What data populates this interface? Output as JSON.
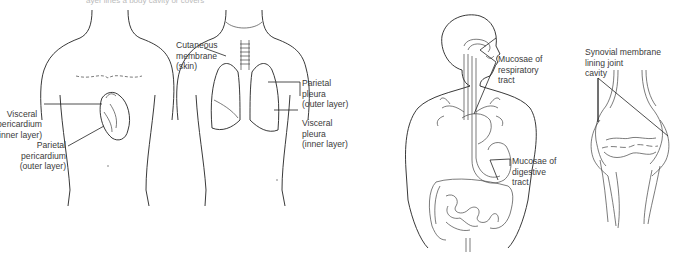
{
  "caption": "ayer lines a body cavity or covers",
  "figures": [
    {
      "id": "pericardium",
      "labels": {
        "visceral": "Visceral\npericardium\n(inner layer)",
        "parietal": "Parietal\npericardium\n(outer layer)"
      }
    },
    {
      "id": "pleura",
      "labels": {
        "cutaneous": "Cutaneous\nmembrane\n(skin)",
        "parietal": "Parietal\npleura\n(outer layer)",
        "visceral": "Visceral\npleura\n(inner layer)"
      }
    },
    {
      "id": "mucosae",
      "labels": {
        "respiratory": "Mucosae of\nrespiratory\ntract",
        "digestive": "Mucosae of\ndigestive\ntract"
      }
    },
    {
      "id": "synovial",
      "labels": {
        "synovial": "Synovial membrane\nlining joint\ncavity"
      }
    }
  ]
}
